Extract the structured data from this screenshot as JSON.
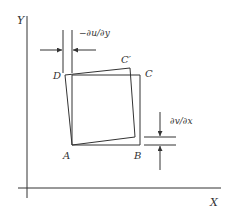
{
  "diagram": {
    "axes": {
      "x_label": "X",
      "y_label": "Y"
    },
    "vertices": {
      "a": "A",
      "b": "B",
      "c": "C",
      "d": "D",
      "c_prime": "C′"
    },
    "dimensions": {
      "shear_u": "−∂u/∂y",
      "shear_v": "∂v/∂x"
    },
    "colors": {
      "line": "#333333",
      "background": "#ffffff"
    }
  }
}
